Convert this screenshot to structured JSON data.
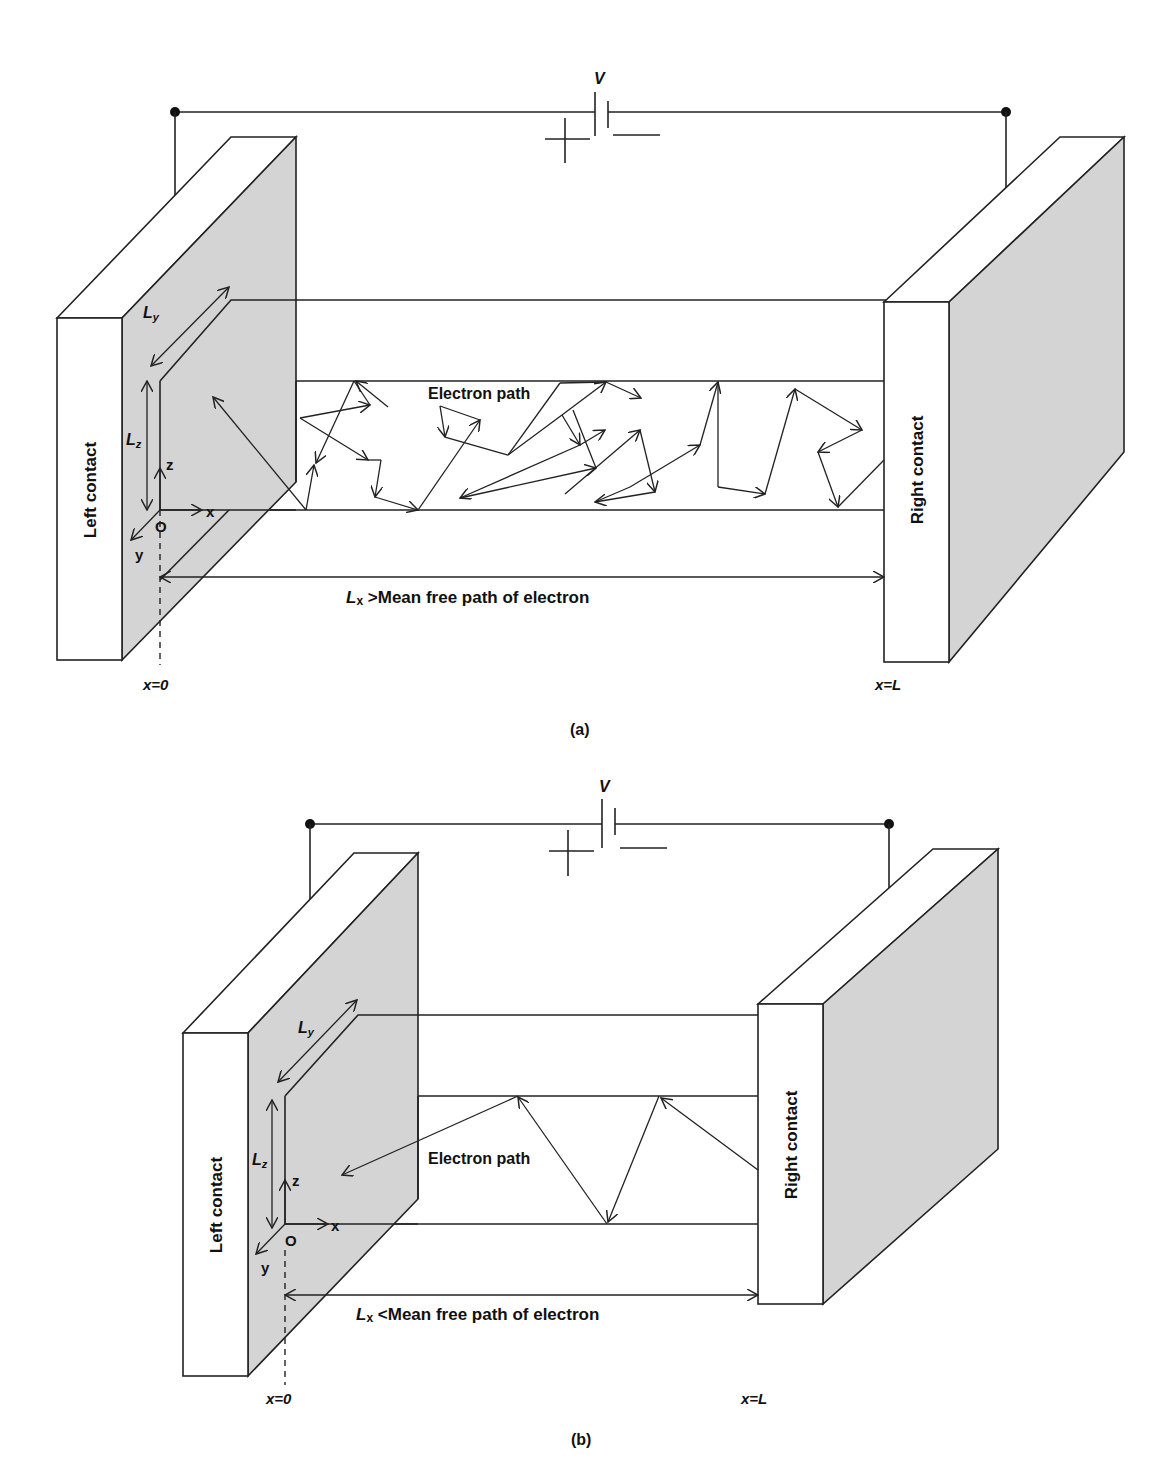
{
  "figure": {
    "panels": [
      {
        "id": "a",
        "caption": "(a)",
        "voltage_label": "V",
        "plus_sign": "+",
        "minus_sign": "—",
        "left_contact": "Left contact",
        "right_contact": "Right contact",
        "dimension_y": "L",
        "dimension_y_sub": "y",
        "dimension_z": "L",
        "dimension_z_sub": "z",
        "axis_origin": "O",
        "axis_x": "x",
        "axis_y": "y",
        "axis_z": "z",
        "path_label": "Electron path",
        "length_label_main": "L",
        "length_label_sub": "x",
        "length_label_rest": " >Mean free path of electron",
        "x_start": "x=0",
        "x_end": "x=L",
        "regime": "diffusive"
      },
      {
        "id": "b",
        "caption": "(b)",
        "voltage_label": "V",
        "plus_sign": "+",
        "minus_sign": "—",
        "left_contact": "Left contact",
        "right_contact": "Right contact",
        "dimension_y": "L",
        "dimension_y_sub": "y",
        "dimension_z": "L",
        "dimension_z_sub": "z",
        "axis_origin": "O",
        "axis_x": "x",
        "axis_y": "y",
        "axis_z": "z",
        "path_label": "Electron path",
        "length_label_main": "L",
        "length_label_sub": "x",
        "length_label_rest": " <Mean free path of electron",
        "x_start": "x=0",
        "x_end": "x=L",
        "regime": "ballistic"
      }
    ],
    "colors": {
      "line": "#222222",
      "contact_side": "#d4d4d4",
      "background": "#ffffff"
    }
  }
}
